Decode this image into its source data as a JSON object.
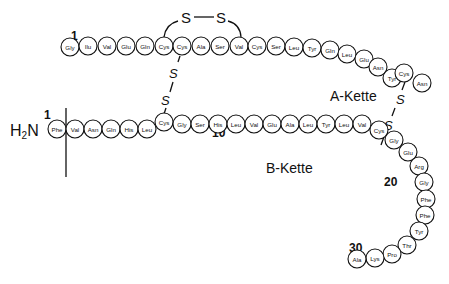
{
  "diagram": {
    "a_chain": {
      "label": "A-Kette",
      "start_number": "1",
      "residues": [
        "Gly",
        "Ilu",
        "Val",
        "Glu",
        "Gln",
        "Cys",
        "Cys",
        "Ala",
        "Ser",
        "Val",
        "Cys",
        "Ser",
        "Leu",
        "Tyr",
        "Gln",
        "Leu",
        "Glu",
        "Asn",
        "Tyr",
        "Cys",
        "Asn"
      ]
    },
    "b_chain": {
      "label": "B-Kette",
      "n_terminus": "H₂N",
      "start_number": "1",
      "marker_10": "10",
      "marker_20": "20",
      "marker_30": "30",
      "residues": [
        "Phe",
        "Val",
        "Asn",
        "Gln",
        "His",
        "Leu",
        "Cys",
        "Gly",
        "Ser",
        "His",
        "Leu",
        "Val",
        "Glu",
        "Ala",
        "Leu",
        "Tyr",
        "Leu",
        "Val",
        "Cys",
        "Gly",
        "Glu",
        "Arg",
        "Gly",
        "Phe",
        "Phe",
        "Tyr",
        "Thr",
        "Pro",
        "Lys",
        "Ala"
      ]
    },
    "disulfide_bonds": [
      {
        "between": "A6-A11",
        "label_left": "S",
        "label_right": "S"
      },
      {
        "between": "A7-B7",
        "label_top": "S",
        "label_bottom": "S"
      },
      {
        "between": "A20-B19",
        "label_top": "S",
        "label_bottom": "S"
      }
    ]
  }
}
